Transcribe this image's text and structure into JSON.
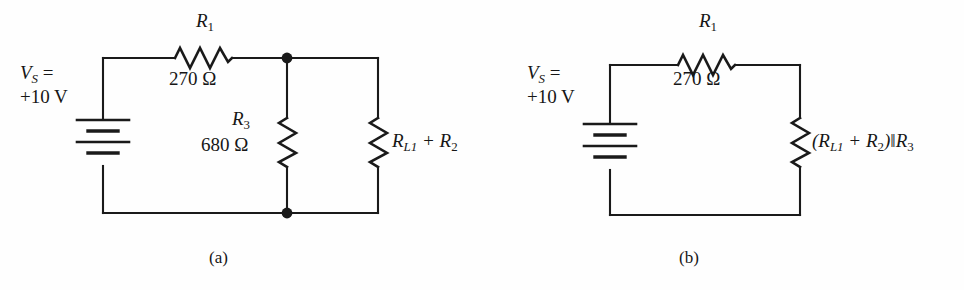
{
  "figure": {
    "background_color": "#fefefe",
    "line_color": "#1a1a1a",
    "text_color": "#161616"
  },
  "circuit_a": {
    "caption": "(a)",
    "source": {
      "name": "V",
      "name_subscript": "S",
      "equals": " =",
      "value": "+10 V",
      "symbol": "battery-icon",
      "cells": 3
    },
    "components": [
      {
        "id": "R1",
        "name": "R",
        "subscript": "1",
        "value": "270 Ω",
        "orientation": "horizontal",
        "symbol": "resistor-zigzag-icon"
      },
      {
        "id": "R3",
        "name": "R",
        "subscript": "3",
        "value": "680 Ω",
        "orientation": "vertical",
        "symbol": "resistor-zigzag-icon"
      },
      {
        "id": "RL1_R2",
        "expression_prefix": "R",
        "expression_subscript": "L1",
        "expression_middle": " + R",
        "expression_subscript2": "2",
        "orientation": "vertical",
        "symbol": "resistor-zigzag-icon"
      }
    ],
    "nodes": [
      {
        "name": "top-junction-node",
        "x": 287,
        "y": 58
      },
      {
        "name": "bottom-junction-node",
        "x": 287,
        "y": 213
      }
    ]
  },
  "circuit_b": {
    "caption": "(b)",
    "source": {
      "name": "V",
      "name_subscript": "S",
      "equals": " =",
      "value": "+10 V",
      "symbol": "battery-icon",
      "cells": 3
    },
    "components": [
      {
        "id": "R1",
        "name": "R",
        "subscript": "1",
        "value": "270 Ω",
        "orientation": "horizontal",
        "symbol": "resistor-zigzag-icon"
      },
      {
        "id": "RL1_R2_par_R3",
        "open_paren": "(R",
        "expression_subscript": "L1",
        "expression_middle": " + R",
        "expression_subscript2": "2",
        "close_paren": ")‖R",
        "expression_subscript3": "3",
        "orientation": "vertical",
        "symbol": "resistor-zigzag-icon"
      }
    ]
  }
}
